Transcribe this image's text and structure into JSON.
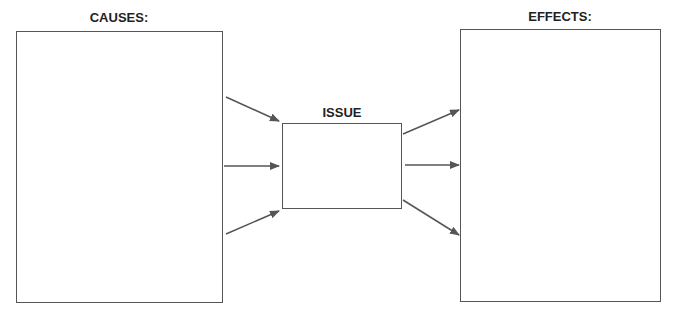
{
  "diagram": {
    "causes": {
      "label": "CAUSES:"
    },
    "issue": {
      "label": "ISSUE"
    },
    "effects": {
      "label": "EFFECTS:"
    },
    "colors": {
      "stroke": "#555555",
      "text": "#222222",
      "background": "#ffffff"
    },
    "arrows": {
      "causes_to_issue": 3,
      "issue_to_effects": 3
    }
  }
}
